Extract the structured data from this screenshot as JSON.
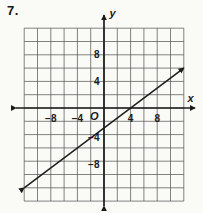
{
  "page": {
    "problem_number": "7."
  },
  "colors": {
    "ink": "#1c1c1c",
    "grid_line": "#4f4f4f",
    "paper": "#fafaf7"
  },
  "chart_data": {
    "type": "line",
    "title": "",
    "xlabel": "x",
    "ylabel": "y",
    "origin_label": "O",
    "x_range": [
      -12,
      12
    ],
    "y_range": [
      -14,
      12
    ],
    "grid_step": 2,
    "grid_on": true,
    "x_ticks": [
      {
        "value": -8,
        "label": "−8"
      },
      {
        "value": -4,
        "label": "−4"
      },
      {
        "value": 4,
        "label": "4"
      },
      {
        "value": 8,
        "label": "8"
      }
    ],
    "y_ticks": [
      {
        "value": 8,
        "label": "8"
      },
      {
        "value": 4,
        "label": "4"
      },
      {
        "value": -4,
        "label": "−4"
      },
      {
        "value": -8,
        "label": "−8"
      }
    ],
    "series": [
      {
        "name": "graphed-line",
        "points": [
          [
            -12,
            -12
          ],
          [
            12,
            6
          ]
        ],
        "slope": 0.75,
        "y_intercept": -3,
        "x_intercept": 4,
        "arrows": "both-ends"
      }
    ]
  }
}
